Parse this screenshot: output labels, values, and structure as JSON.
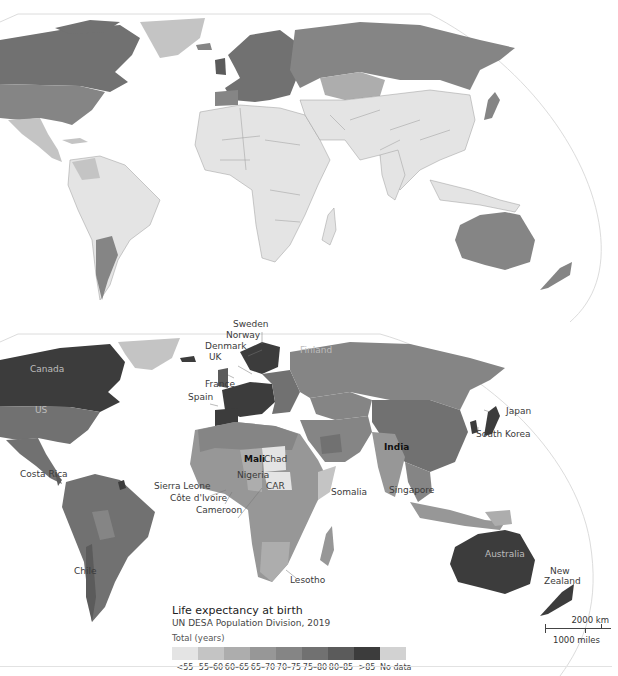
{
  "legend": {
    "title": "Life expectancy at birth",
    "source": "UN DESA Population Division, 2019",
    "unit_label": "Total (years)",
    "bins": [
      {
        "label": "<55",
        "color": "#e4e4e4"
      },
      {
        "label": "55–60",
        "color": "#c4c4c4"
      },
      {
        "label": "60–65",
        "color": "#adadad"
      },
      {
        "label": "65–70",
        "color": "#979797"
      },
      {
        "label": "70–75",
        "color": "#858585"
      },
      {
        "label": "75–80",
        "color": "#717171"
      },
      {
        "label": "80–85",
        "color": "#5b5b5b"
      },
      {
        "label": ">85",
        "color": "#3c3c3c"
      },
      {
        "label": "No data",
        "color": "#d2d2d2"
      }
    ]
  },
  "scale_bar": {
    "km_label": "2000 km",
    "miles_label": "1000 miles"
  },
  "maps": {
    "top": {
      "description": "World map, earlier period, mostly light shading (low life expectancy) except Europe, North America, Russia, Australia"
    },
    "bottom": {
      "labels": {
        "canada": "Canada",
        "us": "US",
        "costa_rica": "Costa Rica",
        "chile": "Chile",
        "sweden": "Sweden",
        "norway": "Norway",
        "denmark": "Denmark",
        "uk": "UK",
        "france": "France",
        "spain": "Spain",
        "finland": "Finland",
        "mali": "Mali",
        "chad": "Chad",
        "nigeria": "Nigeria",
        "car": "CAR",
        "sierra_leone": "Sierra Leone",
        "cote_divoire": "Côte d'Ivoire",
        "cameroon": "Cameroon",
        "somalia": "Somalia",
        "lesotho": "Lesotho",
        "india": "India",
        "singapore": "Singapore",
        "japan": "Japan",
        "south_korea": "South Korea",
        "australia": "Australia",
        "new_zealand_line1": "New",
        "new_zealand_line2": "Zealand"
      }
    }
  }
}
